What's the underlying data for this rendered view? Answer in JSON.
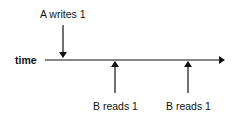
{
  "diagram": {
    "axis_label": "time",
    "events": [
      {
        "label": "A writes 1",
        "direction": "down",
        "x": 63
      },
      {
        "label": "B reads 1",
        "direction": "up",
        "x": 115
      },
      {
        "label": "B reads 1",
        "direction": "up",
        "x": 188
      }
    ],
    "colors": {
      "line": "#111111",
      "background": "#ffffff"
    }
  }
}
